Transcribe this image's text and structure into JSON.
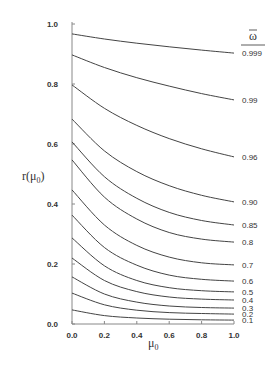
{
  "chart_data": {
    "type": "line",
    "title": "",
    "xlabel": "μ0",
    "ylabel": "r(μ0)",
    "legend_title": "ω̄",
    "xlim": [
      0.0,
      1.0
    ],
    "ylim": [
      0.0,
      1.0
    ],
    "x_ticks": [
      "0.0",
      "0.2",
      "0.4",
      "0.6",
      "0.8",
      "1.0"
    ],
    "y_ticks": [
      "0.0",
      "0.2",
      "0.4",
      "0.6",
      "0.8",
      "1.0"
    ],
    "grid": false,
    "legend_position": "right, inline at curve ends",
    "x": [
      0.0,
      0.2,
      0.4,
      0.6,
      0.8,
      1.0
    ],
    "series": [
      {
        "name": "0.999",
        "values": [
          0.967,
          0.95,
          0.936,
          0.924,
          0.913,
          0.903
        ]
      },
      {
        "name": "0.99",
        "values": [
          0.897,
          0.855,
          0.821,
          0.793,
          0.768,
          0.747
        ]
      },
      {
        "name": "0.96",
        "values": [
          0.797,
          0.719,
          0.662,
          0.618,
          0.584,
          0.557
        ]
      },
      {
        "name": "0.90",
        "values": [
          0.683,
          0.577,
          0.508,
          0.461,
          0.429,
          0.407
        ]
      },
      {
        "name": "0.85",
        "values": [
          0.607,
          0.491,
          0.419,
          0.372,
          0.345,
          0.33
        ]
      },
      {
        "name": "0.8",
        "values": [
          0.547,
          0.423,
          0.35,
          0.305,
          0.283,
          0.273
        ]
      },
      {
        "name": "0.7",
        "values": [
          0.447,
          0.33,
          0.262,
          0.223,
          0.204,
          0.197
        ]
      },
      {
        "name": "0.6",
        "values": [
          0.363,
          0.255,
          0.196,
          0.163,
          0.149,
          0.143
        ]
      },
      {
        "name": "0.5",
        "values": [
          0.287,
          0.194,
          0.145,
          0.121,
          0.111,
          0.107
        ]
      },
      {
        "name": "0.4",
        "values": [
          0.22,
          0.145,
          0.108,
          0.09,
          0.083,
          0.08
        ]
      },
      {
        "name": "0.3",
        "values": [
          0.157,
          0.1,
          0.073,
          0.06,
          0.055,
          0.053
        ]
      },
      {
        "name": "0.2",
        "values": [
          0.103,
          0.064,
          0.046,
          0.038,
          0.035,
          0.033
        ]
      },
      {
        "name": "0.1",
        "values": [
          0.047,
          0.028,
          0.02,
          0.016,
          0.014,
          0.013
        ]
      }
    ]
  },
  "labels": {
    "x_axis_title": "μ",
    "x_axis_sub": "0",
    "y_axis_title": "r(μ",
    "y_axis_sub": "0",
    "y_axis_close": ")",
    "legend_title": "ω"
  }
}
